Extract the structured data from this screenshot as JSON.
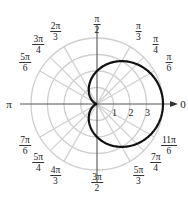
{
  "chart_data": {
    "type": "line",
    "subtype": "polar",
    "title": "",
    "equation": "r = 2 + 2cos(θ)",
    "curve": "cardioid",
    "center_px": [
      97,
      104
    ],
    "unit_px": 16.5,
    "radial_rings": [
      1,
      2,
      3,
      4
    ],
    "radial_tick_labels": [
      "1",
      "2",
      "3"
    ],
    "rmax": 4,
    "angle_labels": [
      {
        "angle_deg": 0,
        "num": "0",
        "den": "",
        "single": true
      },
      {
        "angle_deg": 30,
        "num": "π",
        "den": "6"
      },
      {
        "angle_deg": 45,
        "num": "π",
        "den": "4"
      },
      {
        "angle_deg": 60,
        "num": "π",
        "den": "3"
      },
      {
        "angle_deg": 90,
        "num": "π",
        "den": "2"
      },
      {
        "angle_deg": 120,
        "num": "2π",
        "den": "3"
      },
      {
        "angle_deg": 135,
        "num": "3π",
        "den": "4"
      },
      {
        "angle_deg": 150,
        "num": "5π",
        "den": "6"
      },
      {
        "angle_deg": 180,
        "num": "π",
        "den": "",
        "single": true
      },
      {
        "angle_deg": 210,
        "num": "7π",
        "den": "6"
      },
      {
        "angle_deg": 225,
        "num": "5π",
        "den": "4"
      },
      {
        "angle_deg": 240,
        "num": "4π",
        "den": "3"
      },
      {
        "angle_deg": 270,
        "num": "3π",
        "den": "2"
      },
      {
        "angle_deg": 300,
        "num": "5π",
        "den": "3"
      },
      {
        "angle_deg": 315,
        "num": "7π",
        "den": "4"
      },
      {
        "angle_deg": 330,
        "num": "11π",
        "den": "6"
      }
    ],
    "sample_points": [
      {
        "theta": "0",
        "r": 4
      },
      {
        "theta": "π/3",
        "r": 3
      },
      {
        "theta": "π/2",
        "r": 2
      },
      {
        "theta": "2π/3",
        "r": 1
      },
      {
        "theta": "π",
        "r": 0
      },
      {
        "theta": "4π/3",
        "r": 1
      },
      {
        "theta": "3π/2",
        "r": 2
      },
      {
        "theta": "5π/3",
        "r": 3
      }
    ],
    "grid": true,
    "legend": null,
    "xlabel": "",
    "ylabel": ""
  },
  "colors": {
    "curve": "#111111",
    "axis": "#555555",
    "grid": "#cfcfcf",
    "text": "#222222"
  }
}
